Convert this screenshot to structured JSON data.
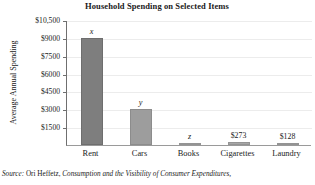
{
  "chart_data": {
    "type": "bar",
    "title": "Household Spending on Selected Items",
    "xlabel": "",
    "ylabel": "Average Annual Spending",
    "categories": [
      "Rent",
      "Cars",
      "Books",
      "Cigarettes",
      "Laundry"
    ],
    "values": [
      9000,
      3000,
      150,
      273,
      128
    ],
    "data_labels": [
      "x",
      "y",
      "z",
      "$273",
      "$128"
    ],
    "data_label_styles": [
      "italic",
      "italic",
      "italic",
      "plain",
      "plain"
    ],
    "ylim": [
      0,
      10500
    ],
    "yticks": [
      1500,
      3000,
      4500,
      6000,
      7500,
      9000,
      10500
    ],
    "ytick_labels": [
      "$1500",
      "$3000",
      "$4500",
      "$6000",
      "$7500",
      "$9000",
      "$10,500"
    ],
    "grid": true,
    "legend": "none",
    "bar_colors": [
      "#7e7e7e",
      "#9d9d9d",
      "#a6a6a6",
      "#a6a6a6",
      "#a6a6a6"
    ]
  },
  "source": {
    "keyword": "Source:",
    "author": " Ori Heffetz, ",
    "work": "Consumption and the Visibility of Consumer Expenditures,"
  },
  "colors": {
    "axis": "#6f6f6f",
    "grid": "#ececec",
    "bar_dark": "#7e7e7e",
    "bar_light": "#a6a6a6",
    "text": "#1a1a1a"
  }
}
